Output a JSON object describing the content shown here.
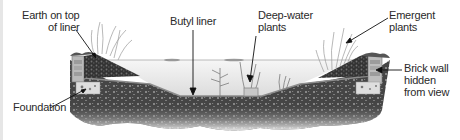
{
  "diagram": {
    "type": "cross-section illustration",
    "colors": {
      "background": "#ffffff",
      "soil_dark": "#3a3a3a",
      "soil_mid": "#6b6b6b",
      "soil_light": "#b8b8b8",
      "water": "#f1f1f1",
      "liner": "#9a9a9a",
      "foundation": "#d9d9d9",
      "text": "#2a2a2a",
      "edge_strip": "#e6e6e6"
    },
    "labels": {
      "earth_line1": "Earth on top",
      "earth_line2": "of liner",
      "foundation": "Foundation",
      "butyl": "Butyl liner",
      "deep_line1": "Deep-water",
      "deep_line2": "plants",
      "emergent_line1": "Emergent",
      "emergent_line2": "plants",
      "brick_line1": "Brick wall",
      "brick_line2": "hidden",
      "brick_line3": "from view"
    }
  }
}
